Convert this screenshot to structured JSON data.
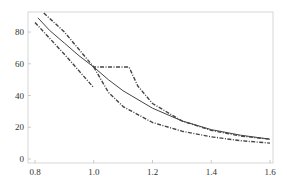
{
  "chart_data": {
    "type": "line",
    "title": "",
    "xlabel": "",
    "ylabel": "",
    "xlim": [
      0.8,
      1.6
    ],
    "ylim": [
      0,
      92
    ],
    "grid": false,
    "legend": null,
    "x_ticks": [
      "0.8",
      "1.0",
      "1.2",
      "1.4",
      "1.6"
    ],
    "y_ticks": [
      "0",
      "20",
      "40",
      "60",
      "80"
    ],
    "series": [
      {
        "name": "solid",
        "style": "solid",
        "x": [
          0.81,
          0.85,
          0.9,
          0.95,
          1.0,
          1.05,
          1.1,
          1.2,
          1.3,
          1.4,
          1.5,
          1.6
        ],
        "y": [
          89,
          81,
          73,
          65,
          58,
          50,
          43,
          32,
          24,
          18.5,
          15,
          12.5
        ]
      },
      {
        "name": "dash-dot-upper",
        "style": "dashdot",
        "x": [
          0.83,
          0.9,
          1.0,
          1.12,
          1.15,
          1.2,
          1.3,
          1.4,
          1.5,
          1.6
        ],
        "y": [
          92,
          80,
          58,
          58,
          46,
          35,
          24,
          18,
          14.5,
          12.5
        ]
      },
      {
        "name": "dash-dot-lower-left",
        "style": "dashdot",
        "x": [
          0.8,
          0.9,
          1.0
        ],
        "y": [
          86,
          66,
          45
        ]
      },
      {
        "name": "dash-dot-lower-right",
        "style": "dashdot",
        "x": [
          1.0,
          1.05,
          1.1,
          1.2,
          1.3,
          1.4,
          1.5,
          1.6
        ],
        "y": [
          58,
          42,
          33,
          23,
          17.5,
          14,
          11.5,
          10
        ]
      }
    ]
  }
}
